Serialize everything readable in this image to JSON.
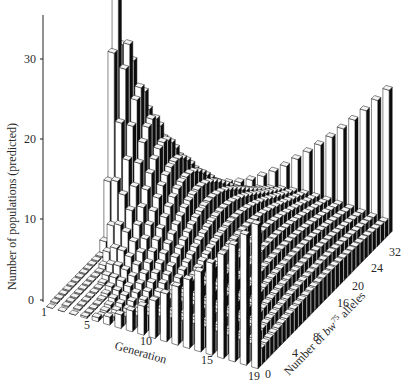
{
  "chart_data": {
    "type": "bar3d",
    "title": "",
    "xlabel": "Generation",
    "ylabel": "Number of bw75 alleles",
    "zlabel": "Number of populations (predicted)",
    "ylabel_parts": {
      "pre": "Number of ",
      "gene": "bw",
      "sup": "75",
      "post": " alleles"
    },
    "x_ticks": [
      "1",
      "5",
      "10",
      "15",
      "19"
    ],
    "y_ticks": [
      "0",
      "4",
      "8",
      "16",
      "20",
      "24",
      "32"
    ],
    "z_ticks": [
      "0",
      "10",
      "20",
      "30"
    ],
    "zlim": [
      0,
      35
    ],
    "generations": 19,
    "allele_range": [
      0,
      32
    ],
    "initial_alleles": 16,
    "populations": 107,
    "fixation_series": [
      {
        "name": "0 alleles (lost)",
        "values": [
          0,
          0,
          0,
          0.2,
          0.5,
          1.0,
          1.7,
          2.6,
          3.6,
          4.7,
          6.0,
          7.3,
          8.6,
          10.0,
          11.5,
          13.0,
          14.6,
          16.3,
          18.0
        ]
      },
      {
        "name": "32 alleles (fixed)",
        "values": [
          0,
          0,
          0,
          0.2,
          0.5,
          1.0,
          1.7,
          2.6,
          3.6,
          4.7,
          6.0,
          7.3,
          8.6,
          10.0,
          11.5,
          13.0,
          14.6,
          16.3,
          18.0
        ]
      }
    ],
    "peak_series": {
      "name": "modal interior class height",
      "values": [
        34,
        25,
        20,
        16.5,
        14,
        12,
        10.5,
        9.3,
        8.3,
        7.4,
        6.6,
        5.9,
        5.3,
        4.8,
        4.3,
        3.9,
        3.5,
        3.2,
        2.9
      ]
    }
  }
}
